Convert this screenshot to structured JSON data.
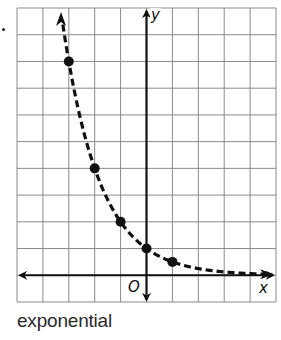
{
  "item_marker": ".",
  "caption": "exponential",
  "axes": {
    "x_label": "x",
    "y_label": "y",
    "origin_label": "O"
  },
  "colors": {
    "grid": "#8a8a8a",
    "axis": "#111111",
    "curve": "#111111",
    "point": "#111111",
    "background": "#ffffff"
  },
  "chart_data": {
    "type": "scatter",
    "title": "",
    "caption": "exponential",
    "xlabel": "x",
    "ylabel": "y",
    "xlim": [
      -5,
      5
    ],
    "ylim": [
      -1,
      10
    ],
    "grid": true,
    "grid_step": 1,
    "series": [
      {
        "name": "points",
        "x": [
          -3,
          -2,
          -1,
          0,
          1
        ],
        "y": [
          8,
          4,
          2,
          1,
          0.5
        ]
      },
      {
        "name": "curve (dashed)",
        "style": "dashed",
        "function": "y = (1/2)^x",
        "x": [
          -3.5,
          -3,
          -2,
          -1,
          0,
          1,
          2,
          3,
          4,
          5
        ],
        "y": [
          11.31,
          8,
          4,
          2,
          1,
          0.5,
          0.25,
          0.125,
          0.0625,
          0.03125
        ]
      }
    ],
    "annotations": [
      "O"
    ],
    "legend": null
  }
}
